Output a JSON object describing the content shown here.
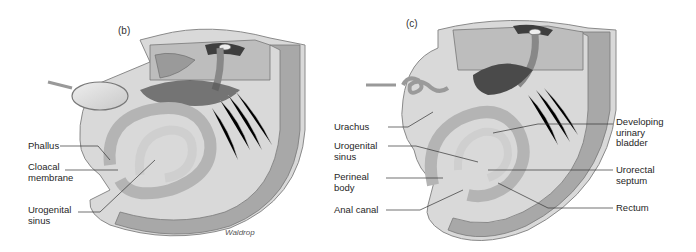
{
  "figure": {
    "panels": [
      {
        "id": "b",
        "letter": "(b)",
        "labels": {
          "phallus": "Phallus",
          "cloacal_membrane": "Cloacal\nmembrane",
          "urogenital_sinus": "Urogenital\nsinus"
        },
        "credit": "Waldrop"
      },
      {
        "id": "c",
        "letter": "(c)",
        "labels": {
          "urachus": "Urachus",
          "urogenital_sinus": "Urogenital\nsinus",
          "perineal_body": "Perineal\nbody",
          "anal_canal": "Anal canal",
          "developing_urinary_bladder": "Developing\nurinary\nbladder",
          "urorectal_septum": "Urorectal\nseptum",
          "rectum": "Rectum"
        }
      }
    ],
    "palette": {
      "wall": "#a8a8a8",
      "wall_edge": "#d6d6d6",
      "tissue_light": "#e4e4e4",
      "tissue_mid": "#bdbdbd",
      "tissue_dark": "#5a5a5a",
      "leader": "#333333"
    }
  }
}
